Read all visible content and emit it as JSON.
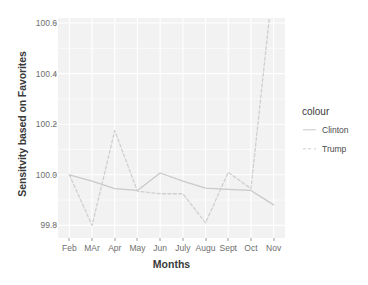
{
  "chart_data": {
    "type": "line",
    "title": "",
    "xlabel": "Months",
    "ylabel": "Sensitvity based on Favorites",
    "categories": [
      "Feb",
      "MAr",
      "Apr",
      "May",
      "Jun",
      "July",
      "Augu",
      "Sept",
      "Oct",
      "Nov"
    ],
    "ylim": [
      99.75,
      100.62
    ],
    "yticks": [
      "99.8",
      "100.0",
      "100.2",
      "100.4",
      "100.6"
    ],
    "ytick_values": [
      99.8,
      100.0,
      100.2,
      100.4,
      100.6
    ],
    "grid": true,
    "legend_position": "right",
    "legend_title": "colour",
    "series": [
      {
        "name": "Clinton",
        "style": "solid",
        "color": "#c9c9c9",
        "values": [
          100.0,
          99.975,
          99.945,
          99.938,
          100.007,
          99.975,
          99.947,
          99.942,
          99.938,
          99.881
        ]
      },
      {
        "name": "Trump",
        "style": "dashed",
        "color": "#cfcfcf",
        "values": [
          100.0,
          99.8,
          100.175,
          99.935,
          99.925,
          99.925,
          99.81,
          100.01,
          99.945,
          100.78
        ]
      }
    ]
  },
  "panel": {
    "background_color": "#f2f2f2",
    "gridline_color": "#ffffff"
  },
  "axis": {
    "tick_color": "#9a9a9a",
    "label_color": "#6e6e6e",
    "title_color": "#3a3a3a"
  }
}
